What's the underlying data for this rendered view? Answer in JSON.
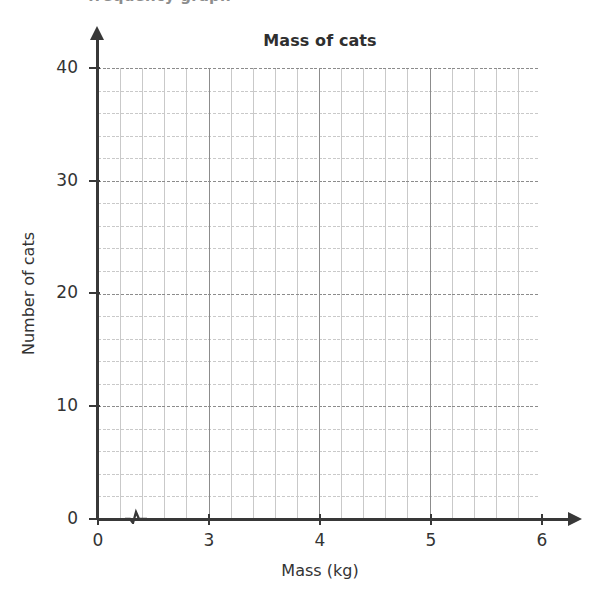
{
  "page": {
    "top_cut_text": "frequency graph",
    "background_color": "#ffffff"
  },
  "chart_data": {
    "type": "grid",
    "title": "Mass of cats",
    "xlabel": "Mass (kg)",
    "ylabel": "Number of cats",
    "xlim": [
      0,
      6
    ],
    "ylim": [
      0,
      40
    ],
    "x_tick_labels": [
      "0",
      "3",
      "4",
      "5",
      "6"
    ],
    "x_tick_values": [
      0,
      3,
      4,
      5,
      6
    ],
    "y_tick_labels": [
      "0",
      "10",
      "20",
      "30",
      "40"
    ],
    "y_tick_values": [
      0,
      10,
      20,
      30,
      40
    ],
    "x_major_step": 1,
    "x_minor_step": 0.2,
    "y_major_step": 10,
    "y_minor_step": 2,
    "grid": true,
    "grid_minor_color": "#c9c9c9",
    "grid_major_color": "#8c8c8c",
    "axis_color": "#383838",
    "axis_break_x": true,
    "legend": null,
    "series": [],
    "values": [],
    "note": "Empty graph paper / blank axes for plotting a frequency graph; no data plotted."
  },
  "axis_titles": {
    "x": "Mass (kg)",
    "y": "Number of cats"
  },
  "labels": {
    "x": [
      {
        "text": "0",
        "px": 98
      },
      {
        "text": "3",
        "px": 209
      },
      {
        "text": "4",
        "px": 320
      },
      {
        "text": "5",
        "px": 431
      },
      {
        "text": "6",
        "px": 542
      }
    ],
    "y": [
      {
        "text": "40",
        "px": 68
      },
      {
        "text": "30",
        "px": 181
      },
      {
        "text": "20",
        "px": 293
      },
      {
        "text": "10",
        "px": 406
      },
      {
        "text": "0",
        "px": 519
      }
    ]
  }
}
